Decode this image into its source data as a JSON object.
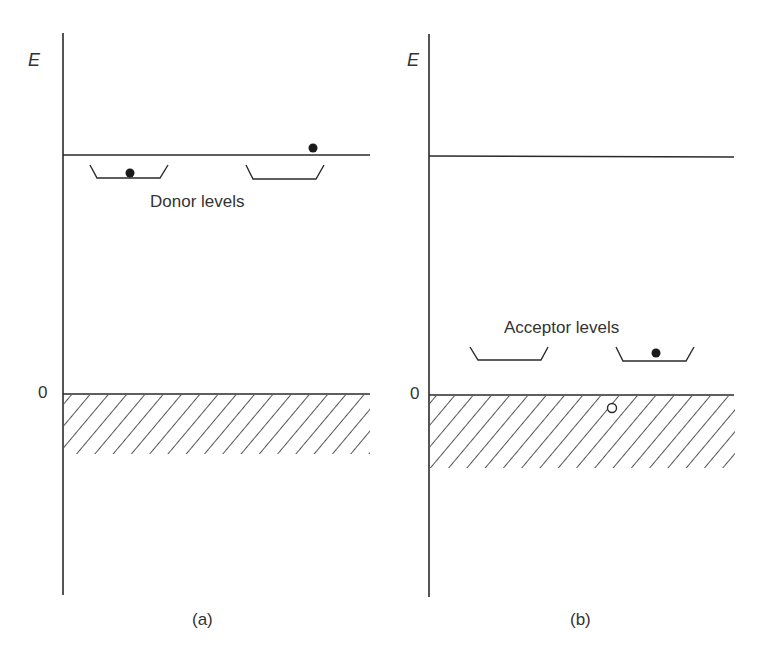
{
  "figure": {
    "panels": [
      {
        "id": "a",
        "caption": "(a)",
        "axis_label": "E",
        "zero_label": "0",
        "levels_label": "Donor levels",
        "description": "n-type semiconductor: donor levels just below conduction band edge; one electron remains in a donor level, one promoted into conduction band"
      },
      {
        "id": "b",
        "caption": "(b)",
        "axis_label": "E",
        "zero_label": "0",
        "levels_label": "Acceptor levels",
        "description": "p-type semiconductor: acceptor levels just above valence band edge; one electron captured by an acceptor level, leaving a hole in the valence band"
      }
    ],
    "colors": {
      "line": "#2a2a2a",
      "background": "#ffffff"
    }
  }
}
